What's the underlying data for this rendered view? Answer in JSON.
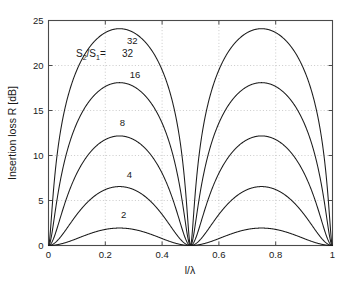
{
  "chart_data": {
    "type": "line",
    "title": "",
    "xlabel": "l/λ",
    "ylabel": "Insertion loss R [dB]",
    "xlim": [
      0,
      1
    ],
    "ylim": [
      0,
      25
    ],
    "xticks": [
      0,
      0.2,
      0.4,
      0.6,
      0.8,
      1
    ],
    "xticklabels": [
      "0",
      "0.2",
      "0.4",
      "0.6",
      "0.8",
      "1"
    ],
    "yticks": [
      0,
      5,
      10,
      15,
      20,
      25
    ],
    "yticklabels": [
      "0",
      "5",
      "10",
      "15",
      "20",
      "25"
    ],
    "grid": true,
    "grid_style": "dotted",
    "legend": "inline-curve-labels",
    "annotation": {
      "prefix": "S",
      "sub_numerator": "2",
      "slash": "/S",
      "sub_denominator": "1",
      "equals": "=",
      "value": "32",
      "full_text": "S2/S1= 32"
    },
    "formula": "R = 10*log10(1 + 0.25*(n - 1/n)^2 * sin^2(2*pi*x))",
    "series": [
      {
        "name": "32",
        "label": "32",
        "ratio": 32,
        "peak_value": 24.1,
        "peak_x": 0.25,
        "label_x": 0.295,
        "label_y": 22.4,
        "color": "#1c1c1c"
      },
      {
        "name": "16",
        "label": "16",
        "ratio": 16,
        "peak_value": 18.1,
        "peak_x": 0.25,
        "label_x": 0.305,
        "label_y": 18.6,
        "color": "#1c1c1c"
      },
      {
        "name": "8",
        "label": "8",
        "ratio": 8,
        "peak_value": 12.1,
        "peak_x": 0.25,
        "label_x": 0.26,
        "label_y": 13.3,
        "color": "#1c1c1c"
      },
      {
        "name": "4",
        "label": "4",
        "ratio": 4,
        "peak_value": 6.5,
        "peak_x": 0.25,
        "label_x": 0.285,
        "label_y": 7.5,
        "color": "#1c1c1c"
      },
      {
        "name": "2",
        "label": "2",
        "ratio": 2,
        "peak_value": 2.1,
        "peak_x": 0.25,
        "label_x": 0.265,
        "label_y": 3.1,
        "color": "#1c1c1c"
      }
    ],
    "x_sample_points": [
      0,
      0.05,
      0.1,
      0.15,
      0.2,
      0.25,
      0.3,
      0.35,
      0.4,
      0.45,
      0.5,
      0.55,
      0.6,
      0.65,
      0.7,
      0.75,
      0.8,
      0.85,
      0.9,
      0.95,
      1
    ],
    "zeros_at": [
      0,
      0.5,
      1
    ],
    "maxima_at": [
      0.25,
      0.75
    ]
  }
}
